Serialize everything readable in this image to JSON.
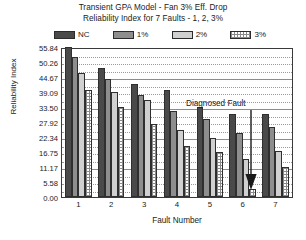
{
  "chart_data": {
    "type": "bar",
    "title": "Transient GPA Model - Fan 3% Eff. Drop",
    "subtitle": "Reliability Index for 7 Faults - 1, 2, 3%",
    "xlabel": "Fault Number",
    "ylabel": "Reliability Index",
    "categories": [
      "1",
      "2",
      "3",
      "4",
      "5",
      "6",
      "7"
    ],
    "series": [
      {
        "name": "NC",
        "color": "#4a4a4a",
        "values": [
          55.84,
          48.0,
          42.0,
          40.0,
          33.5,
          31.0,
          31.0
        ]
      },
      {
        "name": "1%",
        "color": "#8e8e8e",
        "values": [
          52.0,
          44.0,
          38.0,
          32.0,
          29.0,
          24.0,
          26.0
        ]
      },
      {
        "name": "2%",
        "color": "#d0d0d0",
        "values": [
          46.0,
          39.0,
          36.0,
          25.0,
          22.0,
          14.0,
          17.0
        ]
      },
      {
        "name": "3%",
        "color": "#ffffff",
        "values": [
          40.0,
          33.5,
          27.0,
          19.0,
          16.7,
          3.0,
          11.0
        ]
      }
    ],
    "ylim": [
      0.0,
      55.84
    ],
    "yticks": [
      "0.00",
      "5.58",
      "11.17",
      "16.75",
      "22.34",
      "27.92",
      "33.50",
      "39.09",
      "44.67",
      "50.26",
      "55.84"
    ],
    "grid": true,
    "legend_position": "top",
    "annotations": [
      {
        "text": "Diagnosed Fault",
        "target_category": "6",
        "target_series": "3%"
      }
    ]
  },
  "legend": {
    "items": [
      {
        "label": "NC"
      },
      {
        "label": "1%"
      },
      {
        "label": "2%"
      },
      {
        "label": "3%"
      }
    ]
  }
}
